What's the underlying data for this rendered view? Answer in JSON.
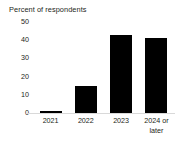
{
  "chart_data": {
    "type": "bar",
    "title": "Percent of respondents",
    "xlabel": "",
    "ylabel": "",
    "categories": [
      "2021",
      "2022",
      "2023",
      "2024 or later"
    ],
    "values": [
      1,
      15,
      43,
      41
    ],
    "ylim": [
      0,
      50
    ],
    "yticks": [
      0,
      10,
      20,
      30,
      40,
      50
    ],
    "ytick_labels": [
      "0",
      "10",
      "20",
      "30",
      "40",
      "50"
    ],
    "grid": false,
    "legend": null,
    "bar_color": "#000000",
    "axis_color": "#d9d9d9",
    "text_color": "#231f20"
  }
}
